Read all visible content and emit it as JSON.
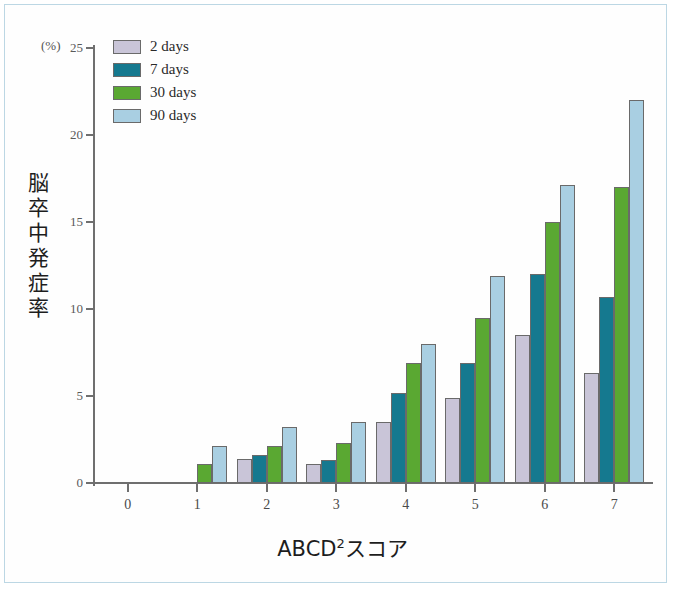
{
  "figure": {
    "unit_label": "(%)",
    "y_title": "脳卒中発症率",
    "x_title_main": "ABCD",
    "x_title_sup": "2",
    "x_title_tail": "スコア"
  },
  "legend": {
    "items": [
      {
        "label": "2 days",
        "color": "#c9c5d8"
      },
      {
        "label": "7 days",
        "color": "#15798f"
      },
      {
        "label": "30 days",
        "color": "#5aa832"
      },
      {
        "label": "90 days",
        "color": "#a9cfe2"
      }
    ]
  },
  "chart_data": {
    "type": "bar",
    "title": "",
    "xlabel": "ABCD2スコア",
    "ylabel": "脳卒中発症率 (%)",
    "categories": [
      "0",
      "1",
      "2",
      "3",
      "4",
      "5",
      "6",
      "7"
    ],
    "ylim": [
      0,
      25
    ],
    "yticks": [
      0,
      5,
      10,
      15,
      20,
      25
    ],
    "grid": false,
    "legend_position": "top-left",
    "series": [
      {
        "name": "2 days",
        "color": "#c9c5d8",
        "values": [
          0,
          0,
          1.4,
          1.1,
          3.5,
          4.9,
          8.5,
          6.3
        ]
      },
      {
        "name": "7 days",
        "color": "#15798f",
        "values": [
          0,
          0,
          1.6,
          1.3,
          5.2,
          6.9,
          12.0,
          10.7
        ]
      },
      {
        "name": "30 days",
        "color": "#5aa832",
        "values": [
          0,
          1.1,
          2.1,
          2.3,
          6.9,
          9.5,
          15.0,
          17.0
        ]
      },
      {
        "name": "90 days",
        "color": "#a9cfe2",
        "values": [
          0,
          2.1,
          3.2,
          3.5,
          8.0,
          11.9,
          17.1,
          22.0
        ]
      }
    ]
  }
}
